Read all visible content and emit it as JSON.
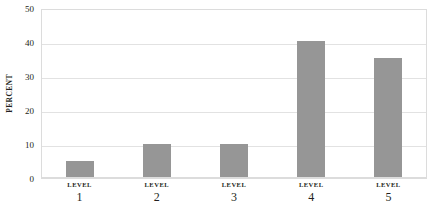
{
  "chart_data": {
    "type": "bar",
    "title": "",
    "subtitle": "",
    "xlabel": "",
    "ylabel": "PERCENT",
    "categories": [
      "LEVEL 1",
      "LEVEL 2",
      "LEVEL 3",
      "LEVEL 4",
      "LEVEL 5"
    ],
    "category_lines": [
      {
        "word": "LEVEL",
        "number": "1"
      },
      {
        "word": "LEVEL",
        "number": "2"
      },
      {
        "word": "LEVEL",
        "number": "3"
      },
      {
        "word": "LEVEL",
        "number": "4"
      },
      {
        "word": "LEVEL",
        "number": "5"
      }
    ],
    "values": [
      5,
      10,
      10,
      40.3,
      35.2
    ],
    "ylim": [
      0,
      50
    ],
    "ytick_labels": [
      "0",
      "10",
      "20",
      "30",
      "40",
      "50"
    ],
    "ytick_values": [
      0,
      10,
      20,
      30,
      40,
      50
    ],
    "grid": "horizontal",
    "legend": "none",
    "bar_color": "#969696",
    "gridline_color": "#e2e2e2",
    "border_color": "#dcdcdc",
    "background_color": "#ffffff",
    "text_color": "#231f20"
  }
}
